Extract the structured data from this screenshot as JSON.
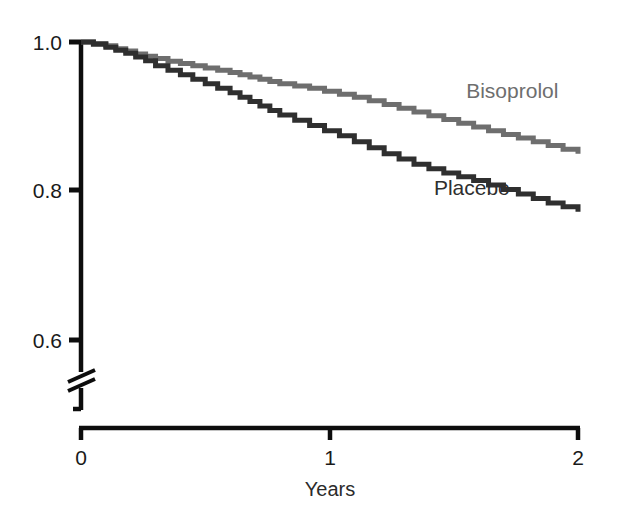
{
  "chart_data": {
    "type": "line",
    "title": "",
    "subtitle": "",
    "xlabel": "Years",
    "ylabel": "",
    "xlim": [
      0,
      2
    ],
    "ylim": [
      0.6,
      1.0
    ],
    "grid": false,
    "legend_position": "inline-annotation",
    "axis_break": true,
    "axis_break_note": "y-axis broken below 0.6",
    "x_ticks": [
      "0",
      "1",
      "2"
    ],
    "x_tick_values": [
      0,
      1,
      2
    ],
    "y_ticks": [
      "1.0",
      "0.8",
      "0.6"
    ],
    "y_tick_values": [
      1.0,
      0.8,
      0.6
    ],
    "annotations": [
      {
        "text": "Bisoprolol",
        "x": 1.55,
        "y": 0.925,
        "color": "#6e6e6e"
      },
      {
        "text": "Placebo",
        "x": 1.42,
        "y": 0.795,
        "color": "#2f2f2f"
      }
    ],
    "series": [
      {
        "name": "Bisoprolol",
        "color": "#6e6e6e",
        "step": "step-after",
        "x": [
          0.0,
          0.05,
          0.1,
          0.14,
          0.18,
          0.22,
          0.26,
          0.3,
          0.35,
          0.4,
          0.45,
          0.5,
          0.55,
          0.6,
          0.64,
          0.68,
          0.72,
          0.76,
          0.8,
          0.86,
          0.92,
          0.98,
          1.04,
          1.1,
          1.16,
          1.22,
          1.28,
          1.34,
          1.4,
          1.46,
          1.52,
          1.58,
          1.64,
          1.7,
          1.76,
          1.82,
          1.88,
          1.94,
          2.0
        ],
        "y": [
          1.0,
          0.998,
          0.995,
          0.991,
          0.988,
          0.984,
          0.981,
          0.978,
          0.974,
          0.971,
          0.968,
          0.965,
          0.962,
          0.959,
          0.956,
          0.953,
          0.95,
          0.947,
          0.944,
          0.941,
          0.938,
          0.934,
          0.93,
          0.926,
          0.921,
          0.916,
          0.911,
          0.906,
          0.901,
          0.896,
          0.891,
          0.886,
          0.881,
          0.876,
          0.871,
          0.866,
          0.861,
          0.856,
          0.85
        ]
      },
      {
        "name": "Placebo",
        "color": "#2f2f2f",
        "step": "step-after",
        "x": [
          0.0,
          0.05,
          0.1,
          0.14,
          0.18,
          0.22,
          0.26,
          0.3,
          0.35,
          0.4,
          0.45,
          0.5,
          0.55,
          0.6,
          0.64,
          0.68,
          0.72,
          0.76,
          0.8,
          0.86,
          0.92,
          0.98,
          1.04,
          1.1,
          1.16,
          1.22,
          1.28,
          1.34,
          1.4,
          1.46,
          1.52,
          1.58,
          1.64,
          1.7,
          1.76,
          1.82,
          1.88,
          1.94,
          2.0
        ],
        "y": [
          1.0,
          0.997,
          0.993,
          0.989,
          0.985,
          0.98,
          0.975,
          0.968,
          0.962,
          0.956,
          0.95,
          0.944,
          0.938,
          0.932,
          0.926,
          0.92,
          0.914,
          0.908,
          0.902,
          0.895,
          0.888,
          0.881,
          0.874,
          0.866,
          0.858,
          0.85,
          0.843,
          0.836,
          0.83,
          0.824,
          0.819,
          0.814,
          0.808,
          0.802,
          0.796,
          0.79,
          0.784,
          0.779,
          0.772
        ]
      }
    ]
  },
  "axis": {
    "color": "#0d0d0d",
    "y_title": "",
    "x_title": "Years",
    "break_symbol": "double-slash"
  },
  "labels": {
    "y_1_0": "1.0",
    "y_0_8": "0.8",
    "y_0_6": "0.6",
    "x_0": "0",
    "x_1": "1",
    "x_2": "2",
    "x_axis_title": "Years",
    "series_bisoprolol": "Bisoprolol",
    "series_placebo": "Placebo"
  },
  "colors": {
    "bisoprolol": "#6e6e6e",
    "placebo": "#2f2f2f",
    "axis": "#0d0d0d",
    "background": "#ffffff"
  }
}
